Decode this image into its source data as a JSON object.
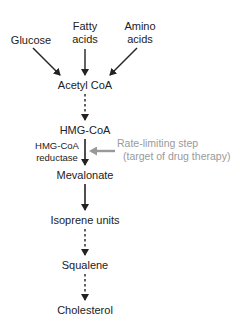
{
  "diagram": {
    "type": "metabolic-pathway",
    "sources": [
      {
        "id": "glucose",
        "label": "Glucose"
      },
      {
        "id": "fatty-acids",
        "label_line1": "Fatty",
        "label_line2": "acids"
      },
      {
        "id": "amino-acids",
        "label_line1": "Amino",
        "label_line2": "acids"
      }
    ],
    "steps": [
      {
        "id": "acetyl-coa",
        "label": "Acetyl CoA"
      },
      {
        "id": "hmg-coa",
        "label": "HMG-CoA"
      },
      {
        "id": "mevalonate",
        "label": "Mevalonate"
      },
      {
        "id": "isoprene-units",
        "label": "Isoprene units"
      },
      {
        "id": "squalene",
        "label": "Squalene"
      },
      {
        "id": "cholesterol",
        "label": "Cholesterol"
      }
    ],
    "enzyme": {
      "line1": "HMG-CoA",
      "line2": "reductase"
    },
    "annotation": {
      "line1": "Rate-limiting step",
      "line2": "(target of drug therapy)",
      "color": "#9a9a9a"
    },
    "edges": [
      {
        "from": "glucose",
        "to": "acetyl-coa",
        "style": "solid"
      },
      {
        "from": "fatty-acids",
        "to": "acetyl-coa",
        "style": "solid"
      },
      {
        "from": "amino-acids",
        "to": "acetyl-coa",
        "style": "solid"
      },
      {
        "from": "acetyl-coa",
        "to": "hmg-coa",
        "style": "dashed"
      },
      {
        "from": "hmg-coa",
        "to": "mevalonate",
        "style": "solid"
      },
      {
        "from": "mevalonate",
        "to": "isoprene-units",
        "style": "solid"
      },
      {
        "from": "isoprene-units",
        "to": "squalene",
        "style": "dashed"
      },
      {
        "from": "squalene",
        "to": "cholesterol",
        "style": "dashed"
      }
    ]
  }
}
